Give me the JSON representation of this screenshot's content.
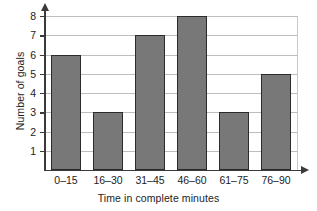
{
  "chart_data": {
    "type": "bar",
    "title": "",
    "subtitle": "",
    "categories": [
      "0–15",
      "16–30",
      "31–45",
      "46–60",
      "61–75",
      "76–90"
    ],
    "values": [
      6,
      3,
      7,
      8,
      3,
      5
    ],
    "xlabel": "Time in complete minutes",
    "ylabel": "Number of goals",
    "ylim": [
      0,
      8
    ],
    "y_ticks": [
      1,
      2,
      3,
      4,
      5,
      6,
      7,
      8
    ],
    "y_tick_labels": [
      "1",
      "2",
      "3",
      "4",
      "5",
      "6",
      "7",
      "8"
    ],
    "grid": "horizontal",
    "legend": "none",
    "bar_fill_color": "#787878",
    "bar_edge_color": "#2b2b2b",
    "gridline_color": "#bdbdbd",
    "axis_color": "#3a3a3a",
    "background_color": "#ffffff"
  }
}
